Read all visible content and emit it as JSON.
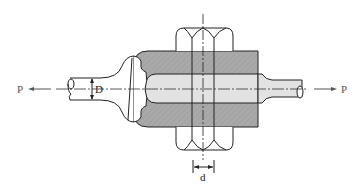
{
  "diagram": {
    "labels": {
      "load_left": "P",
      "load_right": "P",
      "rod_diameter": "D",
      "pin_diameter": "d"
    },
    "colors": {
      "line": "#222222",
      "block_fill": "#a8a8a8",
      "bore_fill": "#e2e2e2",
      "background": "#ffffff",
      "label": "#555555"
    },
    "components": [
      {
        "name": "left-rod",
        "description": "Rod with enlarged head, diameter D"
      },
      {
        "name": "clevis-block",
        "description": "Hatched (gray) block with axial bore"
      },
      {
        "name": "pin",
        "description": "Transverse pin, diameter d, passing through block"
      },
      {
        "name": "right-rod",
        "description": "Rod extending from block to the right"
      }
    ]
  }
}
